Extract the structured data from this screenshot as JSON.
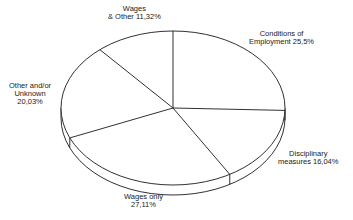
{
  "chart_data": {
    "type": "pie",
    "style": "3d-tilted-pie",
    "title": "",
    "categories": [
      "Conditions of Employment",
      "Disciplinary measures",
      "Wages only",
      "Other and/or Unknown",
      "Wages & Other"
    ],
    "values": [
      25.5,
      16.04,
      27.11,
      20.03,
      11.32
    ],
    "value_labels": [
      "25,5%",
      "16,04%",
      "27,11%",
      "20,03%",
      "11,32%"
    ],
    "start_angle_deg": 90,
    "direction": "clockwise",
    "legend": "none",
    "colors": {
      "stroke": "#1a1a1a",
      "fill": "#ffffff"
    }
  },
  "labels": {
    "wages_other": {
      "line1": "Wages",
      "line2": "& Other 11,32%"
    },
    "conditions": {
      "line1": "Conditions of",
      "line2": "Employment 25,5%"
    },
    "other_unknown": {
      "line1": "Other and/or",
      "line2": "Unknown",
      "line3": "20,03%"
    },
    "disciplinary": {
      "line1": "Disciplinary",
      "line2": "measures 16,04%"
    },
    "wages_only": {
      "line1": "Wages only",
      "line2": "27,11%"
    }
  }
}
